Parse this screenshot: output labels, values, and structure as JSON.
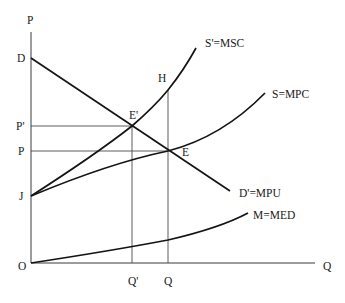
{
  "diagram": {
    "type": "economics-externality-diagram",
    "colors": {
      "background": "#ffffff",
      "line": "#141414",
      "axis": "#3a3a3a",
      "text": "#1a1a1a"
    },
    "axes": {
      "y_label": "P",
      "x_label": "Q",
      "origin_label": "O"
    },
    "y_ticks": [
      {
        "label": "D",
        "meaning": "demand intercept"
      },
      {
        "label": "P'",
        "meaning": "socially optimal price"
      },
      {
        "label": "P",
        "meaning": "market price"
      },
      {
        "label": "J",
        "meaning": "supply intercept"
      }
    ],
    "x_ticks": [
      {
        "label": "Q'",
        "meaning": "socially optimal quantity"
      },
      {
        "label": "Q",
        "meaning": "market quantity"
      }
    ],
    "curves": [
      {
        "id": "msc",
        "label": "S'=MSC",
        "shape": "convex upward curve from J"
      },
      {
        "id": "mpc",
        "label": "S=MPC",
        "shape": "concave-ish upward curve from J"
      },
      {
        "id": "mpu",
        "label": "D'=MPU",
        "shape": "downward sloping line from D"
      },
      {
        "id": "med",
        "label": "M=MED",
        "shape": "convex upward curve from O"
      }
    ],
    "points": [
      {
        "label": "E'",
        "meaning": "MSC = MPU intersection at (Q', P')"
      },
      {
        "label": "E",
        "meaning": "MPC = MPU intersection at (Q, P)"
      },
      {
        "label": "H",
        "meaning": "MSC at quantity Q"
      }
    ]
  }
}
